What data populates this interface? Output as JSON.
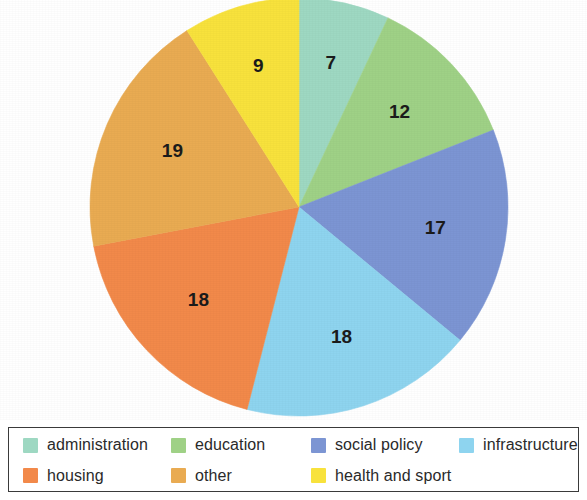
{
  "chart_data": {
    "type": "pie",
    "title": "",
    "subtitle": "",
    "xlabel": "",
    "ylabel": "",
    "legend_position": "bottom",
    "grid": false,
    "start_angle_deg": 0,
    "direction": "clockwise",
    "total": 100,
    "categories": [
      "administration",
      "education",
      "social policy",
      "infrastructure",
      "housing",
      "other",
      "health and sport"
    ],
    "values": [
      7,
      12,
      17,
      18,
      18,
      19,
      9
    ],
    "colors": [
      "#9ed8c2",
      "#9fd186",
      "#7c95d3",
      "#8ed4ef",
      "#f2894a",
      "#e9ab52",
      "#f8e23c"
    ],
    "slices": [
      {
        "label": "administration",
        "value": 7,
        "color": "#9ed8c2",
        "data_label": "7"
      },
      {
        "label": "education",
        "value": 12,
        "color": "#9fd186",
        "data_label": "12"
      },
      {
        "label": "social policy",
        "value": 17,
        "color": "#7c95d3",
        "data_label": "17"
      },
      {
        "label": "infrastructure",
        "value": 18,
        "color": "#8ed4ef",
        "data_label": "18"
      },
      {
        "label": "housing",
        "value": 18,
        "color": "#f2894a",
        "data_label": "18"
      },
      {
        "label": "other",
        "value": 19,
        "color": "#e9ab52",
        "data_label": "19"
      },
      {
        "label": "health and sport",
        "value": 9,
        "color": "#f8e23c",
        "data_label": "9"
      }
    ]
  },
  "legend": {
    "items": [
      {
        "label": "administration",
        "color": "#9ed8c2"
      },
      {
        "label": "education",
        "color": "#9fd186"
      },
      {
        "label": "social policy",
        "color": "#7c95d3"
      },
      {
        "label": "infrastructure",
        "color": "#8ed4ef"
      },
      {
        "label": "housing",
        "color": "#f2894a"
      },
      {
        "label": "other",
        "color": "#e9ab52"
      },
      {
        "label": "health and sport",
        "color": "#f8e23c"
      }
    ]
  },
  "geometry": {
    "center_x": 299,
    "center_y": 207,
    "radius": 209
  }
}
